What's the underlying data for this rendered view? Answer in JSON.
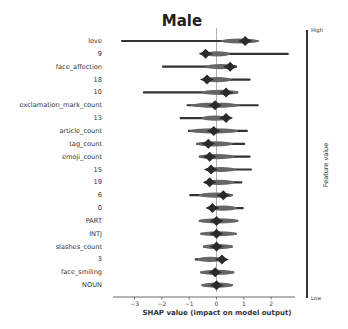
{
  "chart_data": {
    "type": "beeswarm",
    "title": "Male",
    "xlabel": "SHAP value (impact on model output)",
    "ylabel": "",
    "xlim": [
      -3.77,
      2.89
    ],
    "xticks": [
      -3,
      -2,
      -1,
      0,
      1,
      2
    ],
    "xtick_labels": [
      "−3",
      "−2",
      "−1",
      "0",
      "1",
      "2"
    ],
    "colorbar": {
      "label": "Feature value",
      "high": "High",
      "low": "Low"
    },
    "features": [
      {
        "name": "love",
        "min": -3.5,
        "max": 1.55,
        "peak": 1.05
      },
      {
        "name": "9",
        "min": -0.45,
        "max": 2.65,
        "peak": -0.4
      },
      {
        "name": "face_affection",
        "min": -2.0,
        "max": 0.75,
        "peak": 0.5
      },
      {
        "name": "18",
        "min": -0.5,
        "max": 1.25,
        "peak": -0.35
      },
      {
        "name": "10",
        "min": -2.7,
        "max": 0.8,
        "peak": 0.35
      },
      {
        "name": "exclamation_mark_count",
        "min": -1.1,
        "max": 1.55,
        "peak": -0.05
      },
      {
        "name": "13",
        "min": -1.35,
        "max": 0.45,
        "peak": 0.35
      },
      {
        "name": "article_count",
        "min": -1.05,
        "max": 1.15,
        "peak": -0.1
      },
      {
        "name": "tag_count",
        "min": -0.75,
        "max": 1.05,
        "peak": -0.3
      },
      {
        "name": "emoji_count",
        "min": -0.65,
        "max": 1.25,
        "peak": -0.25
      },
      {
        "name": "15",
        "min": -0.4,
        "max": 1.3,
        "peak": -0.2
      },
      {
        "name": "19",
        "min": -0.45,
        "max": 0.95,
        "peak": -0.25
      },
      {
        "name": "6",
        "min": -1.0,
        "max": 0.6,
        "peak": 0.25
      },
      {
        "name": "0",
        "min": -0.25,
        "max": 1.0,
        "peak": -0.15
      },
      {
        "name": "PART",
        "min": -0.65,
        "max": 0.8,
        "peak": 0.0
      },
      {
        "name": "INTJ",
        "min": -0.6,
        "max": 0.75,
        "peak": 0.0
      },
      {
        "name": "slashes_count",
        "min": -0.5,
        "max": 0.6,
        "peak": 0.0
      },
      {
        "name": "3",
        "min": -0.8,
        "max": 0.25,
        "peak": 0.2
      },
      {
        "name": "face_smiling",
        "min": -0.6,
        "max": 0.65,
        "peak": -0.05
      },
      {
        "name": "NOUN",
        "min": -0.55,
        "max": 0.6,
        "peak": 0.0
      }
    ]
  }
}
